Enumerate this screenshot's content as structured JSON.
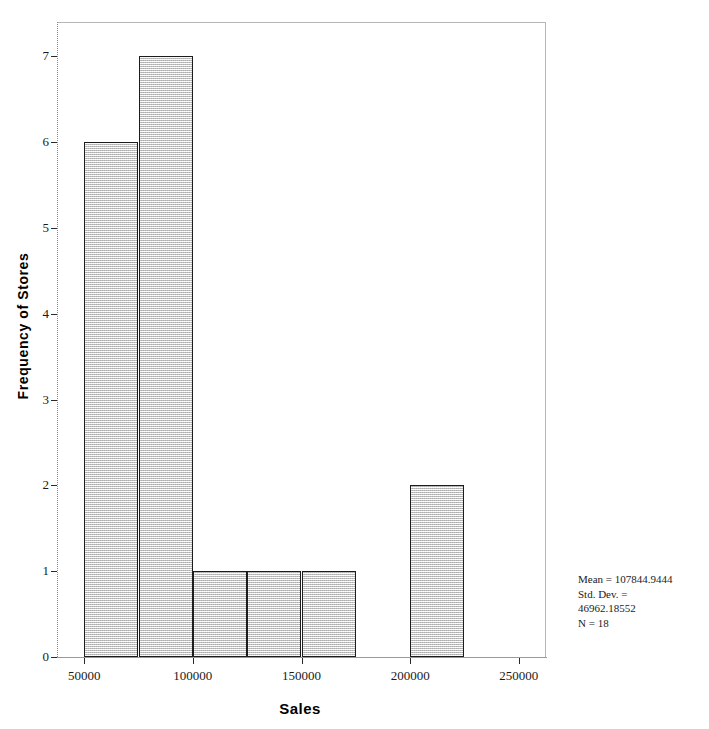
{
  "chart_data": {
    "type": "bar",
    "title": "",
    "subtitle": "",
    "xlabel": "Sales",
    "ylabel": "Frequency of Stores",
    "xlim": [
      37500,
      262500
    ],
    "ylim": [
      0,
      7.4
    ],
    "grid": false,
    "legend": null,
    "bin_width": 25000,
    "categories": [
      "50000-75000",
      "75000-100000",
      "100000-125000",
      "125000-150000",
      "150000-175000",
      "175000-200000",
      "200000-225000"
    ],
    "bin_edges": [
      50000,
      75000,
      100000,
      125000,
      150000,
      175000,
      200000,
      225000
    ],
    "values": [
      6,
      7,
      1,
      1,
      1,
      0,
      2
    ],
    "x_ticks": [
      50000,
      100000,
      150000,
      200000,
      250000
    ],
    "x_tick_labels": [
      "50000",
      "100000",
      "150000",
      "200000",
      "250000"
    ],
    "y_ticks": [
      0,
      1,
      2,
      3,
      4,
      5,
      6,
      7
    ],
    "y_tick_labels": [
      "0",
      "1",
      "2",
      "3",
      "4",
      "5",
      "6",
      "7"
    ],
    "bar_fill_color": "#e2e2e2",
    "bar_border_color": "#1c1c1c",
    "annotations": {
      "mean_label": "Mean = 107844.9444",
      "std_dev_label_line1": "Std. Dev. =",
      "std_dev_label_line2": "46962.18552",
      "n_label": "N = 18",
      "mean_value": 107844.9444,
      "std_dev_value": 46962.18552,
      "n_value": 18
    }
  },
  "axes": {
    "x_title": "Sales",
    "y_title": "Frequency of Stores"
  }
}
